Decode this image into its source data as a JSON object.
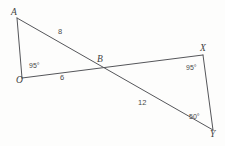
{
  "figure": {
    "background_color": "#fdfdfc",
    "stroke_color": "#55565a",
    "text_color": "#4a4a4a",
    "width": 225,
    "height": 146
  },
  "vertices": [
    {
      "id": "A",
      "label": "A",
      "x": 17,
      "y": 18
    },
    {
      "id": "O",
      "label": "O",
      "x": 22,
      "y": 78
    },
    {
      "id": "B",
      "label": "B",
      "x": 100,
      "y": 66
    },
    {
      "id": "X",
      "label": "X",
      "x": 203,
      "y": 55
    },
    {
      "id": "Y",
      "label": "Y",
      "x": 213,
      "y": 130
    }
  ],
  "segments": [
    {
      "id": "AO",
      "from": "A",
      "to": "O"
    },
    {
      "id": "AY",
      "from": "A",
      "to": "Y"
    },
    {
      "id": "OX",
      "from": "O",
      "to": "X"
    },
    {
      "id": "XY",
      "from": "X",
      "to": "Y"
    }
  ],
  "side_labels": [
    {
      "id": "AB",
      "text": "8",
      "x": 58,
      "y": 31
    },
    {
      "id": "OB",
      "text": "6",
      "x": 60,
      "y": 77
    },
    {
      "id": "BY",
      "text": "12",
      "x": 138,
      "y": 101
    }
  ],
  "angle_labels": [
    {
      "id": "angle-O",
      "text": "95°",
      "x": 29,
      "y": 64
    },
    {
      "id": "angle-X",
      "text": "95°",
      "x": 186,
      "y": 66
    },
    {
      "id": "angle-Y",
      "text": "50°",
      "x": 189,
      "y": 115
    }
  ]
}
